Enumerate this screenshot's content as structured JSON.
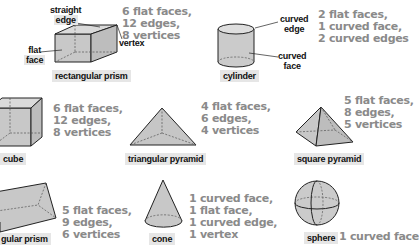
{
  "colors": {
    "shape_fill": "#cfcfcf",
    "shape_stroke": "#222222",
    "label_bg": "#e6e6e6",
    "props_text": "#8a8a8a",
    "callout_text": "#111111"
  },
  "shapes": [
    {
      "name": "rectangular prism",
      "properties": [
        "6 flat faces,",
        "12 edges,",
        "8 vertices"
      ],
      "callouts": {
        "straight_edge": [
          "straight",
          "edge"
        ],
        "flat_face": [
          "flat",
          "face"
        ],
        "vertex": "vertex"
      }
    },
    {
      "name": "cylinder",
      "properties": [
        "2 flat faces,",
        "1 curved face,",
        "2 curved edges"
      ],
      "callouts": {
        "curved_edge": [
          "curved",
          "edge"
        ],
        "curved_face": [
          "curved",
          "face"
        ]
      }
    },
    {
      "name": "cube",
      "properties": [
        "6 flat faces,",
        "12 edges,",
        "8 vertices"
      ]
    },
    {
      "name": "triangular pyramid",
      "properties": [
        "4 flat faces,",
        "6 edges,",
        "4 vertices"
      ]
    },
    {
      "name": "square pyramid",
      "properties": [
        "5 flat faces,",
        "8 edges,",
        "5 vertices"
      ]
    },
    {
      "name": "triangular prism",
      "visible_name": "gular prism",
      "properties": [
        "5 flat faces,",
        "9 edges,",
        "6 vertices"
      ]
    },
    {
      "name": "cone",
      "properties": [
        "1 curved face,",
        "1 flat face,",
        "1 curved edge,",
        "1 vertex"
      ]
    },
    {
      "name": "sphere",
      "properties": [
        "1 curved face"
      ]
    }
  ]
}
